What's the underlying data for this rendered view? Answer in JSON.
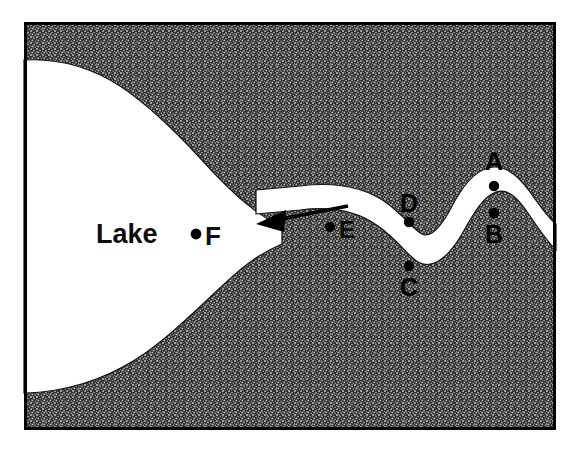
{
  "figure": {
    "frame": {
      "x": 24,
      "y": 22,
      "width": 532,
      "height": 408,
      "border_color": "#000000",
      "border_width": 3
    },
    "colors": {
      "land_fill": "#2b2b2b",
      "land_stipple_light": "#b9b9b9",
      "water_fill": "#ffffff",
      "outline": "#000000",
      "label_text": "#000000"
    },
    "water_body": {
      "name": "Lake",
      "label": "Lake",
      "label_x": 96,
      "label_y": 243,
      "label_font_size": 27
    },
    "flow_arrow": {
      "name": "flow-direction-arrow",
      "direction": "left",
      "tail_x": 348,
      "tail_y": 206,
      "head_x": 258,
      "head_y": 224
    },
    "points": [
      {
        "id": "A",
        "label": "A",
        "dot_x": 494,
        "dot_y": 186,
        "label_x": 494,
        "label_y": 162,
        "label_on_dark": true,
        "description": "outer bank, upper meander crest"
      },
      {
        "id": "B",
        "label": "B",
        "dot_x": 494,
        "dot_y": 213,
        "label_x": 494,
        "label_y": 239,
        "label_on_dark": true,
        "description": "inner bank, upper meander crest"
      },
      {
        "id": "C",
        "label": "C",
        "dot_x": 409,
        "dot_y": 266,
        "label_x": 409,
        "label_y": 292,
        "label_on_dark": true,
        "description": "outer bank, lower meander trough"
      },
      {
        "id": "D",
        "label": "D",
        "dot_x": 409,
        "dot_y": 218,
        "label_x": 409,
        "label_y": 209,
        "label_on_dark": true,
        "description": "inner bank, lower meander trough"
      },
      {
        "id": "E",
        "label": "E",
        "dot_x": 330,
        "dot_y": 227,
        "label_x": 340,
        "label_y": 236,
        "label_on_dark": false,
        "label_font_size": 22,
        "description": "midchannel point upstream of lake"
      },
      {
        "id": "F",
        "label": "F",
        "dot_x": 196,
        "dot_y": 233,
        "label_x": 205,
        "label_y": 243,
        "label_on_dark": false,
        "label_font_size": 25,
        "description": "point within the lake"
      }
    ]
  }
}
